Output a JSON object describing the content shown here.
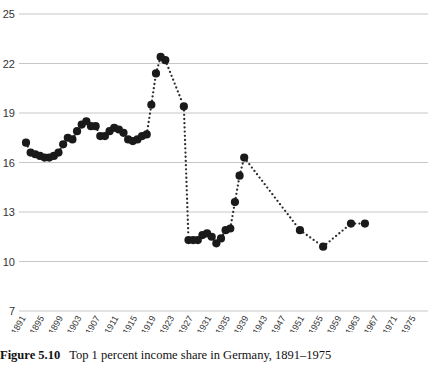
{
  "caption": {
    "label": "Figure 5.10",
    "text": "Top 1 percent income share in Germany, 1891–1975"
  },
  "chart_data": {
    "type": "scatter",
    "title": "Top 1 percent income share in Germany, 1891–1975",
    "xlabel": "",
    "ylabel": "",
    "grid": true,
    "legend": null,
    "marker_color": "#1a1a1a",
    "grid_color": "#b9b9b9",
    "xlim": [
      1890,
      1976
    ],
    "ylim": [
      7,
      25
    ],
    "yticks": [
      7,
      10,
      13,
      16,
      19,
      22,
      25
    ],
    "ytick_labels": [
      "7",
      "10",
      "13",
      "16",
      "19",
      "22",
      "25"
    ],
    "xticks": [
      1891,
      1895,
      1899,
      1903,
      1907,
      1911,
      1915,
      1919,
      1923,
      1927,
      1931,
      1935,
      1939,
      1943,
      1947,
      1951,
      1955,
      1959,
      1963,
      1967,
      1971,
      1975
    ],
    "xtick_labels": [
      "1891",
      "1895",
      "1899",
      "1903",
      "1907",
      "1911",
      "1915",
      "1919",
      "1923",
      "1927",
      "1931",
      "1935",
      "1939",
      "1943",
      "1947",
      "1951",
      "1955",
      "1959",
      "1963",
      "1967",
      "1971",
      "1975"
    ],
    "x": [
      1891,
      1892,
      1893,
      1894,
      1895,
      1896,
      1897,
      1898,
      1899,
      1900,
      1901,
      1902,
      1903,
      1904,
      1905,
      1906,
      1907,
      1908,
      1909,
      1910,
      1911,
      1912,
      1913,
      1914,
      1915,
      1916,
      1917,
      1918,
      1919,
      1920,
      1925,
      1926,
      1927,
      1928,
      1929,
      1930,
      1931,
      1932,
      1933,
      1934,
      1935,
      1936,
      1937,
      1938,
      1950,
      1953,
      1957,
      1961,
      1964
    ],
    "values": [
      17.2,
      16.6,
      16.5,
      16.4,
      16.3,
      16.4,
      16.5,
      16.6,
      17.1,
      17.5,
      17.3,
      17.9,
      18.3,
      18.5,
      18.2,
      18.2,
      17.6,
      17.6,
      17.9,
      18.1,
      18.0,
      17.8,
      17.4,
      17.3,
      17.4,
      17.6,
      17.7,
      19.5,
      21.4,
      22.4,
      22.2,
      19.4,
      11.3,
      11.3,
      11.3,
      11.6,
      11.7,
      11.5,
      11.1,
      11.4,
      11.9,
      12.0,
      13.6,
      15.2,
      16.3,
      11.9,
      10.9,
      12.3,
      12.3
    ],
    "series": [
      {
        "name": "Top 1 percent income share",
        "points": [
          {
            "x": 1891,
            "y": 17.2
          },
          {
            "x": 1892,
            "y": 16.6
          },
          {
            "x": 1893,
            "y": 16.5
          },
          {
            "x": 1894,
            "y": 16.4
          },
          {
            "x": 1895,
            "y": 16.3
          },
          {
            "x": 1896,
            "y": 16.3
          },
          {
            "x": 1897,
            "y": 16.4
          },
          {
            "x": 1898,
            "y": 16.6
          },
          {
            "x": 1899,
            "y": 17.1
          },
          {
            "x": 1900,
            "y": 17.5
          },
          {
            "x": 1901,
            "y": 17.4
          },
          {
            "x": 1902,
            "y": 17.9
          },
          {
            "x": 1903,
            "y": 18.3
          },
          {
            "x": 1904,
            "y": 18.5
          },
          {
            "x": 1905,
            "y": 18.2
          },
          {
            "x": 1906,
            "y": 18.2
          },
          {
            "x": 1907,
            "y": 17.6
          },
          {
            "x": 1908,
            "y": 17.6
          },
          {
            "x": 1909,
            "y": 17.9
          },
          {
            "x": 1910,
            "y": 18.1
          },
          {
            "x": 1911,
            "y": 18.0
          },
          {
            "x": 1912,
            "y": 17.8
          },
          {
            "x": 1913,
            "y": 17.4
          },
          {
            "x": 1914,
            "y": 17.3
          },
          {
            "x": 1915,
            "y": 17.4
          },
          {
            "x": 1916,
            "y": 17.6
          },
          {
            "x": 1917,
            "y": 17.7
          },
          {
            "x": 1918,
            "y": 19.5
          },
          {
            "x": 1919,
            "y": 21.4
          },
          {
            "x": 1920,
            "y": 22.4
          },
          {
            "x": 1921,
            "y": 22.2
          },
          {
            "x": 1925,
            "y": 19.4
          },
          {
            "x": 1926,
            "y": 11.3
          },
          {
            "x": 1927,
            "y": 11.3
          },
          {
            "x": 1928,
            "y": 11.3
          },
          {
            "x": 1929,
            "y": 11.6
          },
          {
            "x": 1930,
            "y": 11.7
          },
          {
            "x": 1931,
            "y": 11.5
          },
          {
            "x": 1932,
            "y": 11.1
          },
          {
            "x": 1933,
            "y": 11.4
          },
          {
            "x": 1934,
            "y": 11.9
          },
          {
            "x": 1935,
            "y": 12.0
          },
          {
            "x": 1936,
            "y": 13.6
          },
          {
            "x": 1937,
            "y": 15.2
          },
          {
            "x": 1938,
            "y": 16.3
          },
          {
            "x": 1950,
            "y": 11.9
          },
          {
            "x": 1955,
            "y": 10.9
          },
          {
            "x": 1961,
            "y": 12.3
          },
          {
            "x": 1964,
            "y": 12.3
          }
        ]
      }
    ],
    "annotations": []
  }
}
